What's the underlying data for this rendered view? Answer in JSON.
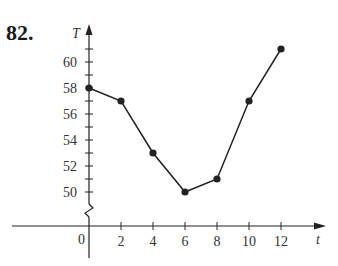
{
  "problem_number": "82.",
  "chart_data": {
    "type": "line",
    "title": "",
    "xlabel": "t",
    "ylabel": "T",
    "x": [
      0,
      2,
      4,
      6,
      8,
      10,
      12
    ],
    "series": [
      {
        "name": "T",
        "values": [
          58,
          57,
          53,
          50,
          51,
          57,
          61
        ]
      }
    ],
    "x_ticks": [
      "2",
      "4",
      "6",
      "8",
      "10",
      "12"
    ],
    "y_ticks": [
      "50",
      "52",
      "54",
      "56",
      "58",
      "60"
    ],
    "origin_label": "0",
    "xlim": [
      0,
      14
    ],
    "ylim": [
      50,
      62
    ],
    "y_axis_break": true,
    "grid": false,
    "legend": "none",
    "markers": "filled-circle",
    "line_color": "#222222"
  }
}
